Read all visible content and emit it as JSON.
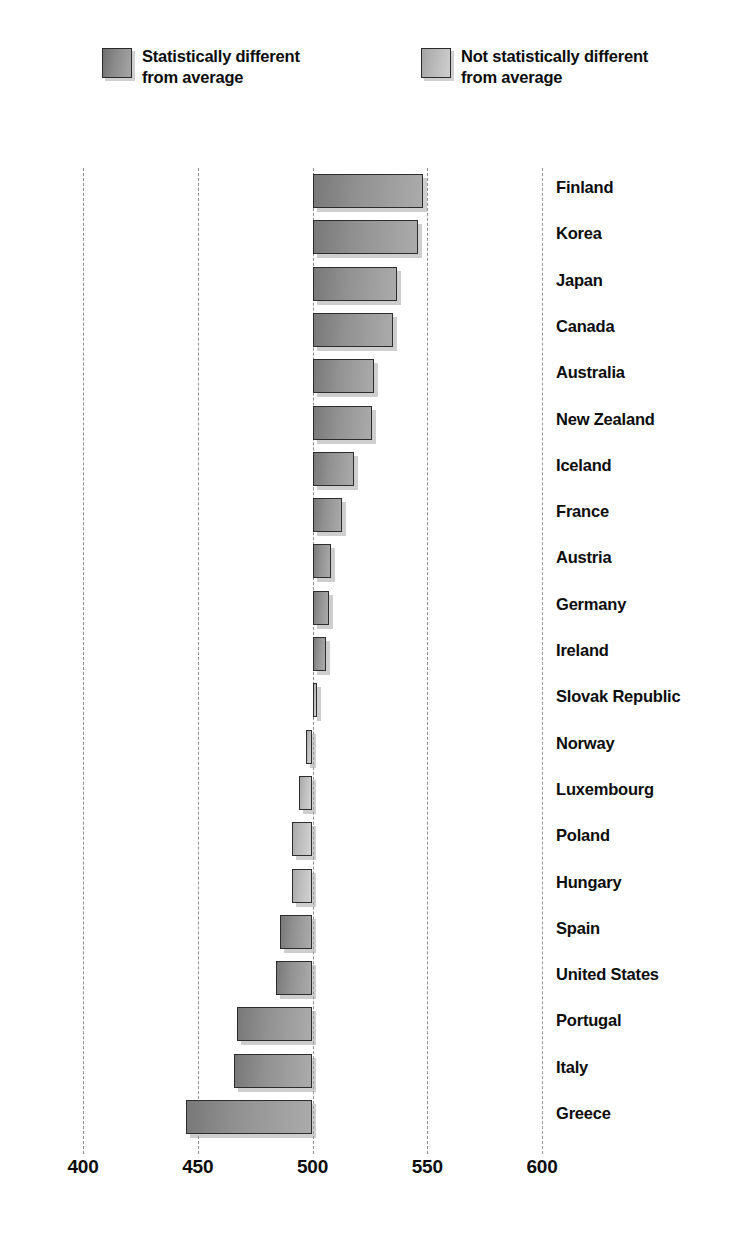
{
  "legend": {
    "items": [
      {
        "label": "Statistically different\nfrom average",
        "style": "dark",
        "swatch_name": "legend-swatch-dark"
      },
      {
        "label": "Not statistically different\nfrom average",
        "style": "light",
        "swatch_name": "legend-swatch-light"
      }
    ]
  },
  "axis": {
    "ticks": [
      "400",
      "450",
      "500",
      "550",
      "600"
    ],
    "tick_values": [
      400,
      450,
      500,
      550,
      600
    ],
    "baseline": 500
  },
  "chart_data": {
    "type": "bar",
    "orientation": "horizontal",
    "title": "",
    "subtitle": "",
    "xlabel": "",
    "ylabel": "",
    "xlim": [
      385,
      605
    ],
    "baseline": 500,
    "grid": true,
    "gridlines": [
      400,
      450,
      500,
      550,
      600
    ],
    "legend_position": "top",
    "legend": [
      "Statistically different from average",
      "Not statistically different from average"
    ],
    "categories": [
      "Finland",
      "Korea",
      "Japan",
      "Canada",
      "Australia",
      "New Zealand",
      "Iceland",
      "France",
      "Austria",
      "Germany",
      "Ireland",
      "Slovak Republic",
      "Norway",
      "Luxembourg",
      "Poland",
      "Hungary",
      "Spain",
      "United States",
      "Portugal",
      "Italy",
      "Greece"
    ],
    "values": [
      548,
      546,
      537,
      535,
      527,
      526,
      518,
      513,
      508,
      507,
      506,
      502,
      497,
      494,
      491,
      491,
      486,
      484,
      467,
      466,
      445
    ],
    "significance": [
      "different",
      "different",
      "different",
      "different",
      "different",
      "different",
      "different",
      "different",
      "different",
      "different",
      "different",
      "not-different",
      "not-different",
      "not-different",
      "not-different",
      "not-different",
      "different",
      "different",
      "different",
      "different",
      "different"
    ]
  },
  "rows": [
    {
      "label": "Finland",
      "value": 548,
      "style": "dark"
    },
    {
      "label": "Korea",
      "value": 546,
      "style": "dark"
    },
    {
      "label": "Japan",
      "value": 537,
      "style": "dark"
    },
    {
      "label": "Canada",
      "value": 535,
      "style": "dark"
    },
    {
      "label": "Australia",
      "value": 527,
      "style": "dark"
    },
    {
      "label": "New Zealand",
      "value": 526,
      "style": "dark"
    },
    {
      "label": "Iceland",
      "value": 518,
      "style": "dark"
    },
    {
      "label": "France",
      "value": 513,
      "style": "dark"
    },
    {
      "label": "Austria",
      "value": 508,
      "style": "dark"
    },
    {
      "label": "Germany",
      "value": 507,
      "style": "dark"
    },
    {
      "label": "Ireland",
      "value": 506,
      "style": "dark"
    },
    {
      "label": "Slovak Republic",
      "value": 502,
      "style": "light"
    },
    {
      "label": "Norway",
      "value": 497,
      "style": "light"
    },
    {
      "label": "Luxembourg",
      "value": 494,
      "style": "light"
    },
    {
      "label": "Poland",
      "value": 491,
      "style": "light"
    },
    {
      "label": "Hungary",
      "value": 491,
      "style": "light"
    },
    {
      "label": "Spain",
      "value": 486,
      "style": "dark"
    },
    {
      "label": "United States",
      "value": 484,
      "style": "dark"
    },
    {
      "label": "Portugal",
      "value": 467,
      "style": "dark"
    },
    {
      "label": "Italy",
      "value": 466,
      "style": "dark"
    },
    {
      "label": "Greece",
      "value": 445,
      "style": "dark"
    }
  ],
  "colors": {
    "bar_dark": "#919191",
    "bar_light": "#bcbcbc",
    "bar_border": "#2c2c2c",
    "gridline": "#8f8f8f",
    "text": "#0d0d0d",
    "background": "#ffffff"
  }
}
